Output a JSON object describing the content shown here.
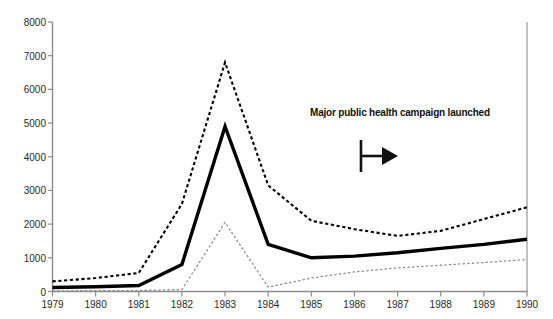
{
  "chart_data": {
    "type": "line",
    "title": "",
    "subtitle": "",
    "xlabel": "",
    "ylabel": "",
    "categories": [
      "1979",
      "1980",
      "1981",
      "1982",
      "1983",
      "1984",
      "1985",
      "1986",
      "1987",
      "1988",
      "1989",
      "1990"
    ],
    "x": [
      1979,
      1980,
      1981,
      1982,
      1983,
      1984,
      1985,
      1986,
      1987,
      1988,
      1989,
      1990
    ],
    "xlim": [
      1979,
      1990
    ],
    "ylim": [
      0,
      8000
    ],
    "y_ticks": [
      0,
      1000,
      2000,
      3000,
      4000,
      5000,
      6000,
      7000,
      8000
    ],
    "y_tick_labels": [
      "0",
      "1000",
      "2000",
      "3000",
      "4000",
      "5000",
      "6000",
      "7000",
      "8000"
    ],
    "grid": false,
    "legend": "none",
    "series": [
      {
        "name": "upper-bound",
        "style": "dashed-bold",
        "color": "#000000",
        "values": [
          300,
          400,
          550,
          2600,
          6800,
          3150,
          2100,
          1850,
          1650,
          1800,
          2150,
          2500
        ]
      },
      {
        "name": "central-estimate",
        "style": "solid-bold",
        "color": "#000000",
        "values": [
          120,
          140,
          180,
          800,
          4900,
          1400,
          1000,
          1050,
          1150,
          1280,
          1400,
          1550
        ]
      },
      {
        "name": "lower-bound",
        "style": "dashed-thin",
        "color": "#8c8c8c",
        "values": [
          20,
          25,
          30,
          60,
          2050,
          130,
          400,
          580,
          700,
          780,
          860,
          950
        ]
      }
    ],
    "annotations": [
      {
        "name": "campaign-annotation",
        "text": "Major public health campaign launched",
        "marker": "bar-with-right-arrow",
        "marker_x_year": 1986.0
      }
    ]
  },
  "axis": {
    "x_tick_labels": [
      "1979",
      "1980",
      "1981",
      "1982",
      "1983",
      "1984",
      "1985",
      "1986",
      "1987",
      "1988",
      "1989",
      "1990"
    ],
    "y_tick_labels": [
      "8000",
      "7000",
      "6000",
      "5000",
      "4000",
      "3000",
      "2000",
      "1000",
      "0"
    ]
  },
  "colors": {
    "background": "#ffffff",
    "axis": "#8c8c8c",
    "series_primary": "#000000",
    "series_lower": "#8c8c8c",
    "text": "#2b2b2b",
    "annotation_text": "#111111"
  }
}
